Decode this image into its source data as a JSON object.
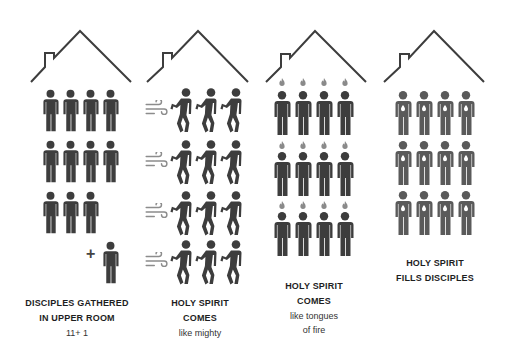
{
  "panels": [
    {
      "id": "gathered",
      "title_line1": "DISCIPLES GATHERED",
      "title_line2": "IN UPPER ROOM",
      "subtitle_line1": "11+ 1",
      "subtitle_line2": "",
      "figure_count": 12,
      "extra_symbol": "+"
    },
    {
      "id": "wind",
      "title_line1": "HOLY SPIRIT",
      "title_line2": "COMES",
      "subtitle_line1": "like mighty",
      "subtitle_line2": "",
      "figure_count": 12,
      "wind_icons": 4
    },
    {
      "id": "fire",
      "title_line1": "HOLY SPIRIT",
      "title_line2": "COMES",
      "subtitle_line1": "like tongues",
      "subtitle_line2": "of fire",
      "figure_count": 12,
      "flame_icons": 12
    },
    {
      "id": "fills",
      "title_line1": "HOLY SPIRIT",
      "title_line2": "FILLS DISCIPLES",
      "subtitle_line1": "",
      "subtitle_line2": "",
      "figure_count": 12
    }
  ],
  "colors": {
    "figure": "#3d3d3d",
    "figure_filled": "#5a5a5a",
    "house_line": "#3d3d3d",
    "flame": "#8a8a8a",
    "wind": "#8c8c8c"
  },
  "icons": [
    "house-icon",
    "person-icon",
    "falling-person-icon",
    "wind-icon",
    "flame-icon",
    "heart-glow-icon",
    "plus-icon"
  ]
}
